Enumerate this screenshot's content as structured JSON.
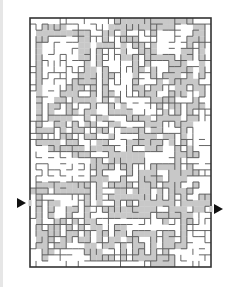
{
  "image": {
    "title": "Maze puzzle with shaded regions",
    "background": "#ffffff",
    "wall_color": "#555555",
    "border_color": "#333333",
    "shade_color": "#c8c8c8"
  },
  "maze": {
    "x": 30,
    "y": 18,
    "width": 181,
    "height": 249,
    "cols": 30,
    "rows": 41,
    "entrance": {
      "side": "left",
      "label": "Start",
      "y": 203
    },
    "exit": {
      "side": "right",
      "label": "Finish",
      "y": 209
    },
    "shade_rows": [
      "..............#############...",
      "..####.......###########...##.",
      ".#########..##.#....#......##.",
      ".##.....##..#..###........###.",
      ".#......##.###.#.##.#.....#.#.",
      ".#......##.#...#..###....##.#.",
      ".#......##.#...###.#####.##.#.",
      ".#.......#.#.....#.#...###..#.",
      ".#.......##.#....##.#..####.#.",
      ".#......###.##...#..#.###.#.#.",
      ".#.....####.#....#...#.#####..",
      ".#....###.#.#....##.##..##.##.",
      ".#...###..#.##....###..###..#.",
      ".#..##.####.#.#.....####...#..",
      ".#.##.#...#..#.#.....#.##.###.",
      ".#.#..##.##..####.....#.#.#...",
      ".#.####..#.##...####.####.##..",
      ".#..##.#.##..##....###..###...",
      ".###.#.##..##..####.##...#....",
      ".#...##..##..#....###.##.#....",
      ".####.##...##...######.#.#....",
      "...######.####..#..###..#.#...",
      ".......###...######.....####..",
      "..........##.######.....#.....",
      "..........####.##...#####.#...",
      "...........#....#.###..#####..",
      "..........###..#..####.###....",
      ".#########.#.####.###.###..#..",
      "###.######.#..##.###.#.####...",
      ".#.......#.#.#######.#.#.#..##",
      ".#.##....#.#..#.#.######.#####",
      ".#.#..##.#..#########..###.##.",
      ".#.#..#..#...#######.######...",
      ".#..##.#.##...........#..##...",
      ".#.##.#.#.##..##.........#....",
      ".####.##.#.##.##.####.##.#....",
      ".###.##.##.#.##.##..#.##.#....",
      ".##.##...##.##.#.##.#.####....",
      "..##.....###...#.##.#.#.......",
      "..#.......####.#.#######......",
      "....................####......"
    ]
  }
}
